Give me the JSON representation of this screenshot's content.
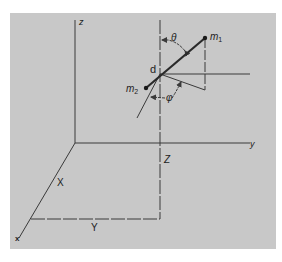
{
  "figure": {
    "background_color": "#c8c8c8",
    "line_color": "#3a3a3a",
    "axes": {
      "z_label": "z",
      "y_label": "y",
      "x_label": "x"
    },
    "coordinates": {
      "X_label": "X",
      "Y_label": "Y",
      "Z_label": "Z"
    },
    "molecule": {
      "m1_base": "m",
      "m1_sub": "1",
      "m2_base": "m",
      "m2_sub": "2",
      "center_label": "d"
    },
    "angles": {
      "theta_label": "θ",
      "phi_label": "φ"
    }
  }
}
